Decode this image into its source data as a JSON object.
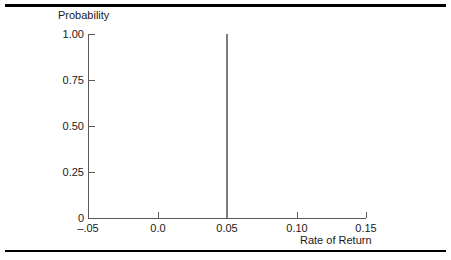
{
  "chart_data": {
    "type": "bar",
    "title": "",
    "xlabel": "Rate of Return",
    "ylabel": "Probability",
    "xlim": [
      -0.05,
      0.15
    ],
    "ylim": [
      0,
      1.0
    ],
    "grid": false,
    "legend": null,
    "x_ticks": [
      {
        "value": -0.05,
        "label": "–.05"
      },
      {
        "value": 0.0,
        "label": "0.0"
      },
      {
        "value": 0.05,
        "label": "0.05"
      },
      {
        "value": 0.1,
        "label": "0.10"
      },
      {
        "value": 0.15,
        "label": "0.15"
      }
    ],
    "y_ticks": [
      {
        "value": 1.0,
        "label": "1.00"
      },
      {
        "value": 0.75,
        "label": "0.75"
      },
      {
        "value": 0.5,
        "label": "0.50"
      },
      {
        "value": 0.25,
        "label": "0.25"
      },
      {
        "value": 0.0,
        "label": "0"
      }
    ],
    "x": [
      0.05
    ],
    "values": [
      1.0
    ],
    "series": [
      {
        "name": "Probability",
        "color": "#7d7d7d",
        "points": [
          {
            "x": 0.05,
            "y": 1.0
          }
        ]
      }
    ]
  },
  "colors": {
    "spike": "#7d7d7d",
    "axis": "#5a5a5a",
    "rule": "#000000",
    "text": "#1a1a1a",
    "background": "#ffffff"
  }
}
